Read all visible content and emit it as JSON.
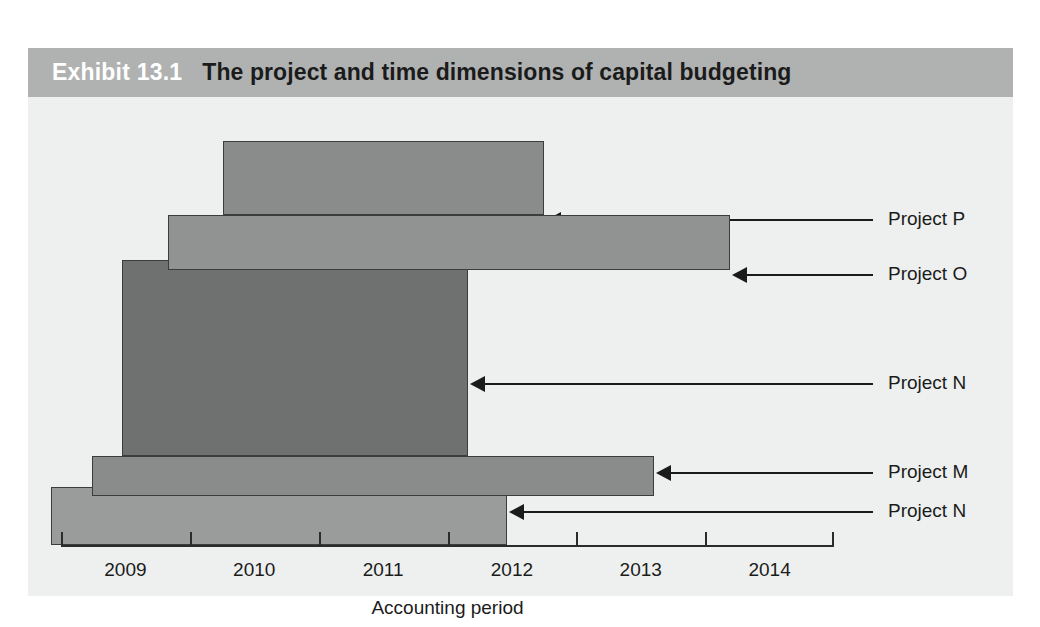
{
  "exhibit": {
    "number": "Exhibit 13.1",
    "title": "The project and time dimensions of capital budgeting",
    "header_bg": "#b0b2b1",
    "body_bg": "#eef0ef"
  },
  "chart_data": {
    "type": "bar",
    "orientation": "horizontal",
    "title": "The project and time dimensions of capital budgeting",
    "xlabel": "Accounting period",
    "ylabel": "",
    "grid": false,
    "legend": "none",
    "xlim": [
      2008.5,
      2014.5
    ],
    "x_ticks": [
      "2009",
      "2010",
      "2011",
      "2012",
      "2013",
      "2014"
    ],
    "x_tick_values": [
      2009,
      2010,
      2011,
      2012,
      2013,
      2014
    ],
    "highlight_band": {
      "label": "2011",
      "start": 2010.5,
      "end": 2011.5,
      "color": "#e8eae9"
    },
    "categories": [
      "Project P",
      "Project O",
      "Project N",
      "Project M",
      "Project N"
    ],
    "series": [
      {
        "name": "Project duration",
        "bars": [
          {
            "label": "Project P",
            "start": 2009.76,
            "end": 2012.25,
            "color": "#8a8c8b"
          },
          {
            "label": "Project O",
            "start": 2009.33,
            "end": 2013.69,
            "color": "#919392"
          },
          {
            "label": "Project N",
            "start": 2008.97,
            "end": 2011.66,
            "color": "#6f7170"
          },
          {
            "label": "Project M",
            "start": 2008.74,
            "end": 2013.1,
            "color": "#8a8c8b"
          },
          {
            "label": "Project N",
            "start": 2008.42,
            "end": 2011.96,
            "color": "#9a9c9b"
          }
        ]
      }
    ]
  },
  "callouts": [
    {
      "label": "Project P"
    },
    {
      "label": "Project O"
    },
    {
      "label": "Project N"
    },
    {
      "label": "Project M"
    },
    {
      "label": "Project N"
    }
  ],
  "axis": {
    "title": "Accounting period",
    "ticks": [
      "2009",
      "2010",
      "2011",
      "2012",
      "2013",
      "2014"
    ]
  }
}
